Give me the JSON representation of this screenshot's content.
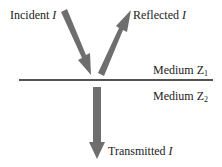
{
  "labels": {
    "incident": "Incident",
    "reflected": "Reflected",
    "transmitted": "Transmitted",
    "intensity_symbol": "I",
    "medium1": "Medium Z",
    "medium1_sub": "1",
    "medium2": "Medium Z",
    "medium2_sub": "2"
  },
  "colors": {
    "arrow": "#6e6e6e",
    "line": "#1a1a1a",
    "text": "#1a1a1a"
  }
}
